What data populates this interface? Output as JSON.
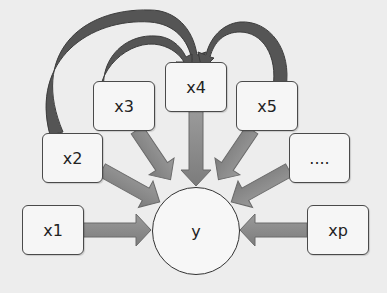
{
  "diagram": {
    "type": "regression-dependency-diagram",
    "colors": {
      "background": "#ededed",
      "node_fill": "#f6f6f6",
      "node_border": "#4a4a4a",
      "arrow_fill": "#8c8c8c",
      "arrow_border": "#6a6a6a",
      "curved_arrow_fill": "#555555"
    },
    "target": {
      "id": "y",
      "label": "y"
    },
    "predictors": [
      {
        "id": "x1",
        "label": "x1"
      },
      {
        "id": "x2",
        "label": "x2"
      },
      {
        "id": "x3",
        "label": "x3"
      },
      {
        "id": "x4",
        "label": "x4"
      },
      {
        "id": "x5",
        "label": "x5"
      },
      {
        "id": "ellipsis",
        "label": "...."
      },
      {
        "id": "xp",
        "label": "xp"
      }
    ],
    "edges": [
      {
        "from": "x1",
        "to": "y",
        "style": "straight"
      },
      {
        "from": "x2",
        "to": "y",
        "style": "straight"
      },
      {
        "from": "x3",
        "to": "y",
        "style": "straight"
      },
      {
        "from": "x4",
        "to": "y",
        "style": "straight"
      },
      {
        "from": "x5",
        "to": "y",
        "style": "straight"
      },
      {
        "from": "ellipsis",
        "to": "y",
        "style": "straight"
      },
      {
        "from": "xp",
        "to": "y",
        "style": "straight"
      },
      {
        "from": "x2",
        "to": "x4",
        "style": "curved"
      },
      {
        "from": "x3",
        "to": "x4",
        "style": "curved"
      },
      {
        "from": "x5",
        "to": "x4",
        "style": "curved"
      }
    ]
  }
}
